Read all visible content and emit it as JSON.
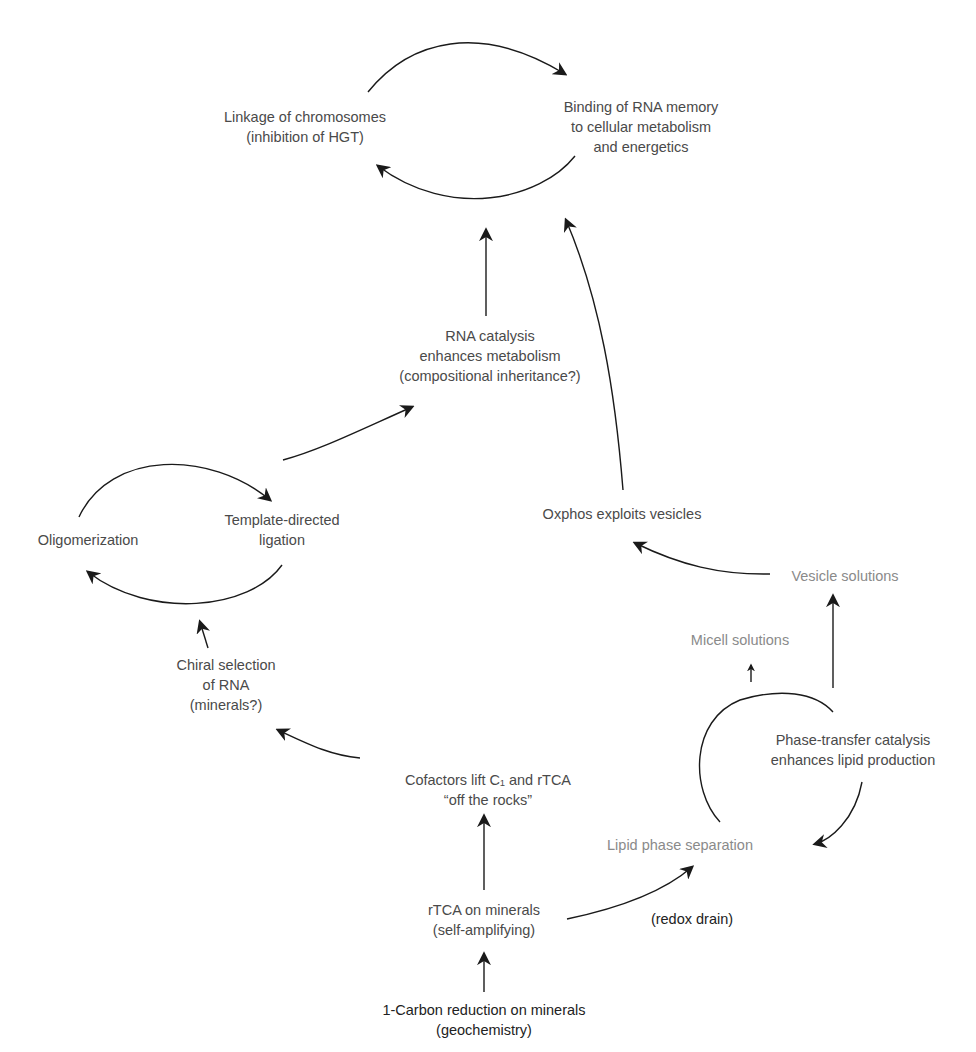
{
  "diagram": {
    "title_cropped": "…cycle of emergence (partially cut off at top)",
    "colors": {
      "arrow": "#1a1a1a",
      "text": "#4a4a4a",
      "text_dark": "#222222",
      "text_light": "#8a8a8a",
      "background": "#ffffff"
    },
    "nodes": {
      "linkage": {
        "lines": [
          "Linkage of chromosomes",
          "(inhibition of HGT)"
        ]
      },
      "binding": {
        "lines": [
          "Binding of RNA memory",
          "to cellular metabolism",
          "and energetics"
        ]
      },
      "rna_catalysis": {
        "lines": [
          "RNA catalysis",
          "enhances metabolism",
          "(compositional inheritance?)"
        ]
      },
      "oligomerization": {
        "lines": [
          "Oligomerization"
        ]
      },
      "template": {
        "lines": [
          "Template-directed",
          "ligation"
        ]
      },
      "oxphos": {
        "lines": [
          "Oxphos exploits vesicles"
        ]
      },
      "vesicle": {
        "lines": [
          "Vesicle solutions"
        ]
      },
      "micell": {
        "lines": [
          "Micell solutions"
        ]
      },
      "chiral": {
        "lines": [
          "Chiral selection",
          "of RNA",
          "(minerals?)"
        ]
      },
      "phase_transfer": {
        "lines": [
          "Phase-transfer catalysis",
          "enhances lipid production"
        ]
      },
      "cofactors": {
        "lines": [
          "Cofactors lift C₁ and rTCA",
          "“off the rocks”"
        ]
      },
      "lipid_phase": {
        "lines": [
          "Lipid phase separation"
        ]
      },
      "rtca": {
        "lines": [
          "rTCA on minerals",
          "(self-amplifying)"
        ]
      },
      "redox": {
        "lines": [
          "(redox drain)"
        ]
      },
      "one_carbon": {
        "lines": [
          "1-Carbon reduction on minerals",
          "(geochemistry)"
        ]
      }
    },
    "edges": [
      {
        "from": "one_carbon",
        "to": "rtca"
      },
      {
        "from": "rtca",
        "to": "cofactors"
      },
      {
        "from": "rtca",
        "to": "lipid_phase",
        "label": "(redox drain)"
      },
      {
        "from": "cofactors",
        "to": "chiral"
      },
      {
        "from": "chiral",
        "to": "oligomerization_cycle"
      },
      {
        "from": "oligomerization",
        "to": "template",
        "cycle": true
      },
      {
        "from": "template",
        "to": "oligomerization",
        "cycle": true
      },
      {
        "from": "template",
        "to": "rna_catalysis"
      },
      {
        "from": "rna_catalysis",
        "to": "binding_cycle"
      },
      {
        "from": "lipid_phase",
        "to": "phase_transfer",
        "cycle": true
      },
      {
        "from": "phase_transfer",
        "to": "lipid_phase",
        "cycle": true
      },
      {
        "from": "phase_transfer",
        "to": "micell"
      },
      {
        "from": "phase_transfer",
        "to": "vesicle"
      },
      {
        "from": "vesicle",
        "to": "oxphos"
      },
      {
        "from": "oxphos",
        "to": "binding_cycle"
      },
      {
        "from": "linkage",
        "to": "binding",
        "cycle": true
      },
      {
        "from": "binding",
        "to": "linkage",
        "cycle": true
      }
    ]
  }
}
